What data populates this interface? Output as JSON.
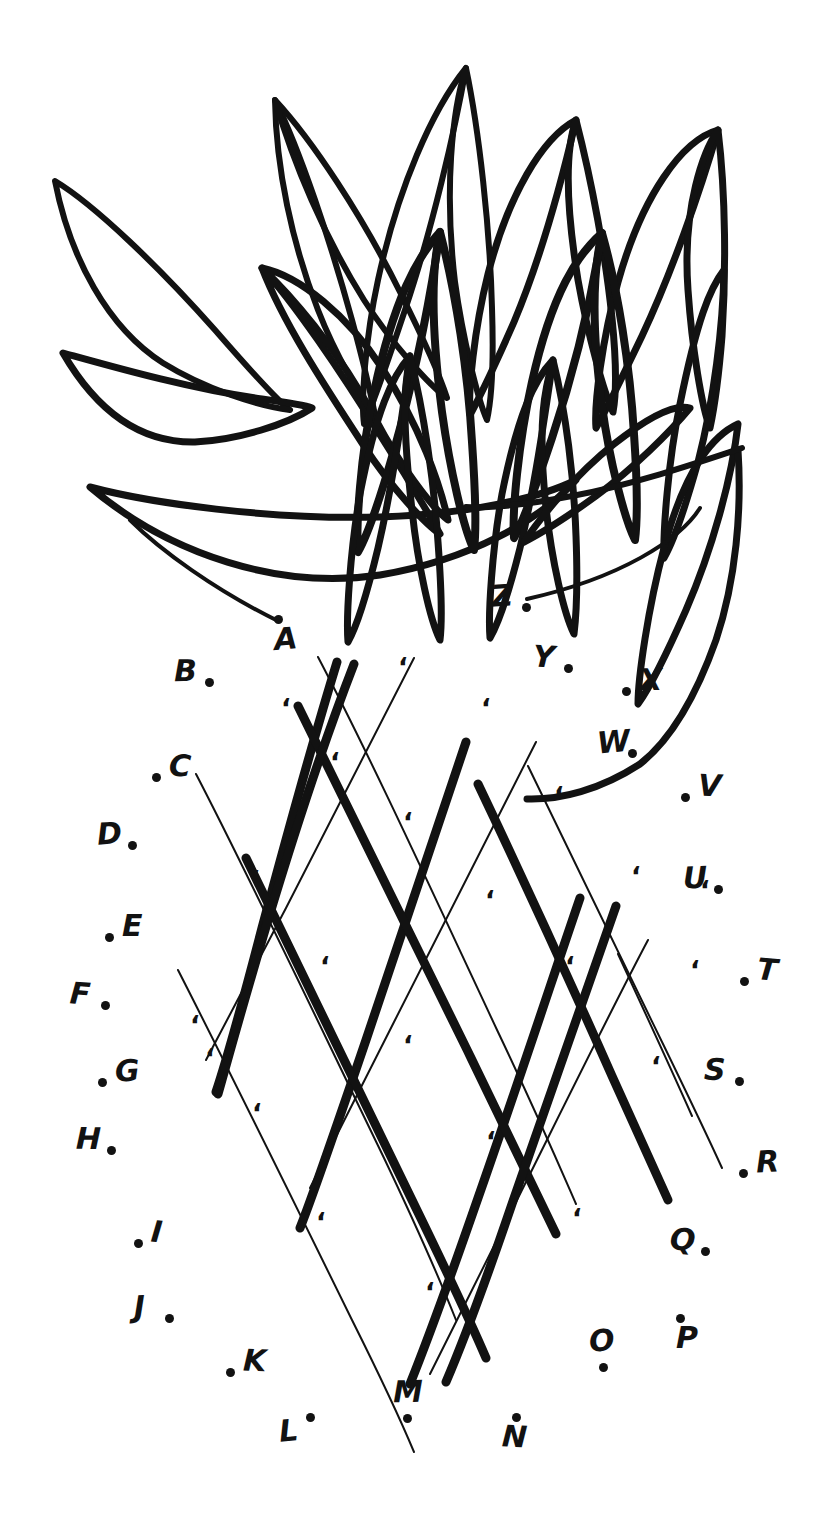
{
  "artwork": {
    "title": "Connect the Dots Pineapple",
    "subject": "pineapple",
    "style": "hand-drawn black ink line art on white",
    "puzzle_type": "connect-the-dots",
    "instruction_strip_text": "CONNECT THE DOTS FROM A TO Z",
    "colors": {
      "ink": "#121212",
      "paper": "#ffffff"
    },
    "crown": {
      "name": "pineapple-crown-leaves",
      "leaf_count": 11,
      "description": "fan of pointed leaves forming the pineapple top"
    },
    "body": {
      "name": "pineapple-body-lattice",
      "description": "diagonal crosshatch diamond lattice with a comma tick inside each cell",
      "thick_lines": 3,
      "thin_lines": 4,
      "tick_count": 22,
      "tick_glyph": "‘"
    },
    "start_node": "A",
    "end_node": "Z"
  },
  "nodes": [
    {
      "label": "A",
      "dot_side": "above-left",
      "x": 283,
      "y": 645
    },
    {
      "label": "B",
      "dot_side": "right",
      "x": 183,
      "y": 677
    },
    {
      "label": "C",
      "dot_side": "left",
      "x": 178,
      "y": 772
    },
    {
      "label": "D",
      "dot_side": "right",
      "x": 106,
      "y": 840
    },
    {
      "label": "E",
      "dot_side": "left",
      "x": 131,
      "y": 932
    },
    {
      "label": "F",
      "dot_side": "right",
      "x": 79,
      "y": 1000
    },
    {
      "label": "G",
      "dot_side": "left",
      "x": 124,
      "y": 1077
    },
    {
      "label": "H",
      "dot_side": "right",
      "x": 85,
      "y": 1145
    },
    {
      "label": "I",
      "dot_side": "left",
      "x": 160,
      "y": 1238
    },
    {
      "label": "J",
      "dot_side": "right",
      "x": 143,
      "y": 1313
    },
    {
      "label": "K",
      "dot_side": "left",
      "x": 252,
      "y": 1367
    },
    {
      "label": "L",
      "dot_side": "above-right",
      "x": 288,
      "y": 1437
    },
    {
      "label": "M",
      "dot_side": "below",
      "x": 402,
      "y": 1398
    },
    {
      "label": "N",
      "dot_side": "above",
      "x": 511,
      "y": 1443
    },
    {
      "label": "O",
      "dot_side": "below",
      "x": 598,
      "y": 1347
    },
    {
      "label": "P",
      "dot_side": "above-left",
      "x": 685,
      "y": 1344
    },
    {
      "label": "Q",
      "dot_side": "right",
      "x": 679,
      "y": 1246
    },
    {
      "label": "R",
      "dot_side": "left",
      "x": 765,
      "y": 1168
    },
    {
      "label": "S",
      "dot_side": "right",
      "x": 713,
      "y": 1076
    },
    {
      "label": "T",
      "dot_side": "left",
      "x": 766,
      "y": 976
    },
    {
      "label": "U",
      "dot_side": "right",
      "x": 692,
      "y": 884
    },
    {
      "label": "V",
      "dot_side": "left",
      "x": 707,
      "y": 792
    },
    {
      "label": "W",
      "dot_side": "right",
      "x": 606,
      "y": 748
    },
    {
      "label": "X",
      "dot_side": "left",
      "x": 648,
      "y": 686
    },
    {
      "label": "Y",
      "dot_side": "right",
      "x": 542,
      "y": 663
    },
    {
      "label": "Z",
      "dot_side": "right",
      "x": 500,
      "y": 602
    }
  ]
}
